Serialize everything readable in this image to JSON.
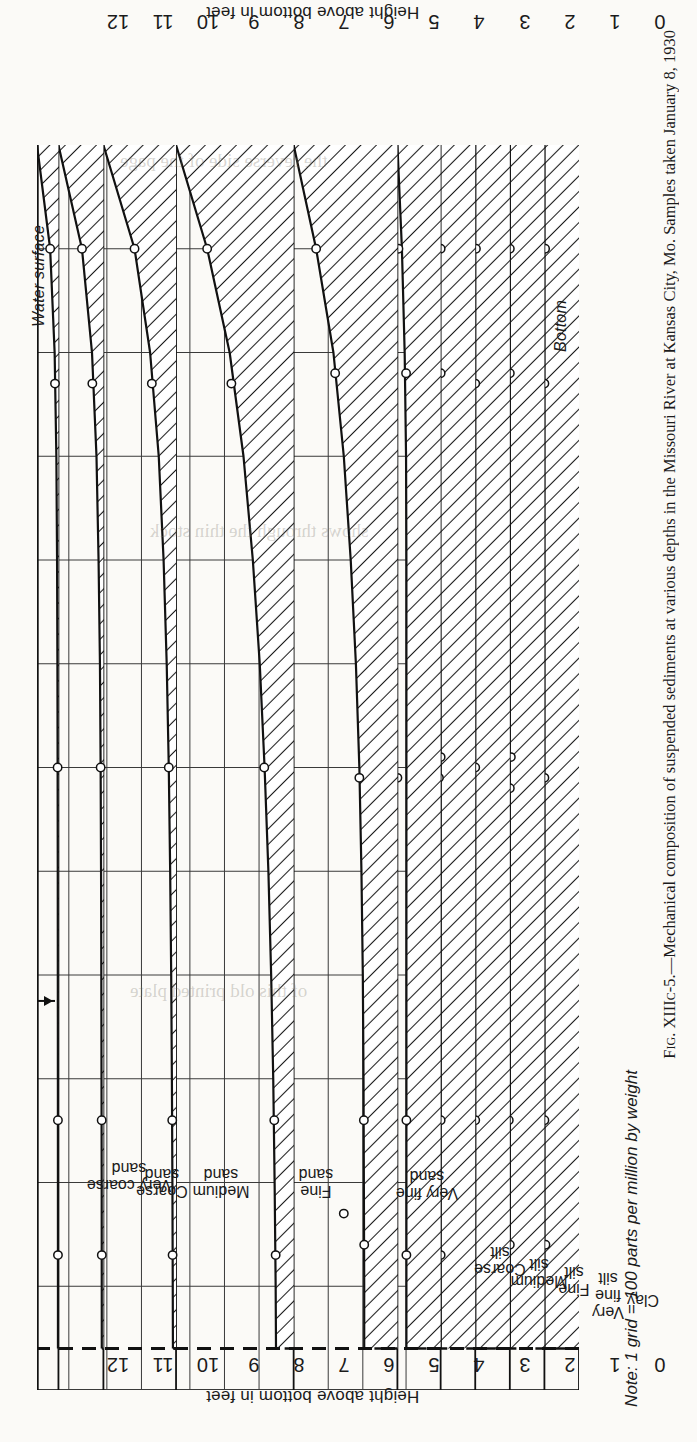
{
  "figure": {
    "note": "Note: 1 grid = 100 parts per million by weight",
    "caption_label": "Fig. XIIIc-5.",
    "caption_dash": "—",
    "caption_text": "Mechanical composition of suspended sediments at various depths in the Missouri River at Kansas City, Mo.   Samples taken January 8, 1930",
    "caption_full": "Fig. XIIIc-5.—Mechanical composition of suspended sediments at various depths in the Missouri River at Kansas City, Mo.   Samples taken January 8, 1930"
  },
  "axes": {
    "y_title_bottom": "Height above bottom in feet",
    "y_title_top": "Height above bottom in feet",
    "y_ticks": [
      "0",
      "1",
      "2",
      "3",
      "4",
      "5",
      "6",
      "7",
      "8",
      "9",
      "10",
      "11",
      "12"
    ],
    "y_min": 0,
    "y_max": 12,
    "x_unit_per_grid_ppm": 100,
    "water_surface_label": "Water surface",
    "bottom_label": "Bottom"
  },
  "chart_data": {
    "type": "area",
    "title": "Mechanical composition of suspended sediments at various depths in the Missouri River at Kansas City, Mo.",
    "xlabel": "Concentration (grid = 100 parts per million by weight)",
    "ylabel": "Height above bottom in feet",
    "ylim": [
      0,
      12
    ],
    "grid": true,
    "legend": "none",
    "orientation": "horizontal-bands: each size class is its own panel; shaded area = concentration profile vs height",
    "water_surface_ft": 11.6,
    "heights_ft": [
      0,
      1,
      2,
      3,
      4,
      5,
      6,
      7,
      8,
      9,
      10,
      11,
      11.6
    ],
    "series": [
      {
        "name": "Clay",
        "panel_width_grids": 1.0,
        "values_grids": [
          1.0,
          1.0,
          1.0,
          1.0,
          1.0,
          1.0,
          1.0,
          1.0,
          1.0,
          1.0,
          1.0,
          1.0,
          1.0
        ],
        "sample_points": [
          {
            "height_ft": 1.0,
            "value_grids": 0.98
          },
          {
            "height_ft": 2.3,
            "value_grids": 1.0
          },
          {
            "height_ft": 6.1,
            "value_grids": 1.0
          },
          {
            "height_ft": 9.4,
            "value_grids": 1.0
          },
          {
            "height_ft": 10.6,
            "value_grids": 0.97
          }
        ]
      },
      {
        "name": "Very fine silt",
        "panel_width_grids": 1.0,
        "values_grids": [
          1.0,
          1.0,
          1.0,
          1.0,
          1.0,
          1.0,
          1.0,
          1.0,
          1.0,
          1.0,
          1.0,
          1.0,
          1.0
        ],
        "sample_points": [
          {
            "height_ft": 1.0,
            "value_grids": 1.0
          },
          {
            "height_ft": 2.2,
            "value_grids": 1.0
          },
          {
            "height_ft": 5.9,
            "value_grids": 0.97
          },
          {
            "height_ft": 6.2,
            "value_grids": 1.0
          },
          {
            "height_ft": 9.4,
            "value_grids": 1.03
          },
          {
            "height_ft": 10.6,
            "value_grids": 1.0
          }
        ]
      },
      {
        "name": "Fine silt",
        "panel_width_grids": 1.0,
        "values_grids": [
          1.0,
          1.0,
          1.0,
          1.0,
          1.0,
          1.0,
          1.0,
          1.0,
          1.0,
          1.0,
          1.0,
          1.0,
          1.0
        ],
        "sample_points": [
          {
            "height_ft": 1.0,
            "value_grids": 0.98
          },
          {
            "height_ft": 2.3,
            "value_grids": 1.0
          },
          {
            "height_ft": 6.0,
            "value_grids": 1.0
          },
          {
            "height_ft": 9.4,
            "value_grids": 1.0
          },
          {
            "height_ft": 10.8,
            "value_grids": 1.1
          }
        ]
      },
      {
        "name": "Medium silt",
        "panel_width_grids": 1.0,
        "values_grids": [
          1.05,
          1.04,
          1.03,
          1.02,
          1.02,
          1.01,
          1.0,
          1.0,
          1.0,
          1.0,
          1.0,
          1.0,
          1.0
        ],
        "sample_points": [
          {
            "height_ft": 1.0,
            "value_grids": 1.0
          },
          {
            "height_ft": 2.2,
            "value_grids": 1.0
          },
          {
            "height_ft": 5.9,
            "value_grids": 1.0
          },
          {
            "height_ft": 6.1,
            "value_grids": 1.05
          },
          {
            "height_ft": 9.4,
            "value_grids": 1.0
          },
          {
            "height_ft": 10.7,
            "value_grids": 1.0
          }
        ]
      },
      {
        "name": "Coarse silt",
        "panel_width_grids": 1.25,
        "values_grids": [
          1.25,
          1.12,
          1.04,
          1.0,
          0.99,
          0.99,
          0.99,
          0.99,
          0.99,
          0.99,
          0.99,
          0.99,
          0.99
        ],
        "sample_points": [
          {
            "height_ft": 1.0,
            "value_grids": 1.22
          },
          {
            "height_ft": 2.2,
            "value_grids": 1.0
          },
          {
            "height_ft": 6.1,
            "value_grids": 1.25
          },
          {
            "height_ft": 9.4,
            "value_grids": 0.99
          },
          {
            "height_ft": 10.7,
            "value_grids": 0.99
          }
        ]
      },
      {
        "name": "Very fine sand",
        "panel_width_grids": 3.0,
        "values_grids": [
          3.0,
          2.35,
          1.85,
          1.55,
          1.35,
          1.2,
          1.1,
          1.04,
          1.0,
          0.98,
          0.97,
          0.96,
          0.96
        ],
        "sample_points": [
          {
            "height_ft": 1.0,
            "value_grids": 2.35
          },
          {
            "height_ft": 2.2,
            "value_grids": 1.8
          },
          {
            "height_ft": 6.1,
            "value_grids": 1.1
          },
          {
            "height_ft": 9.4,
            "value_grids": 0.97
          },
          {
            "height_ft": 10.6,
            "value_grids": 0.96
          },
          {
            "height_ft": 10.3,
            "value_grids": 1.55
          }
        ]
      },
      {
        "name": "Fine sand",
        "panel_width_grids": 3.4,
        "values_grids": [
          3.4,
          2.5,
          1.85,
          1.45,
          1.18,
          0.98,
          0.84,
          0.73,
          0.65,
          0.59,
          0.55,
          0.52,
          0.51
        ],
        "sample_points": [
          {
            "height_ft": 1.0,
            "value_grids": 2.5
          },
          {
            "height_ft": 2.3,
            "value_grids": 1.8
          },
          {
            "height_ft": 6.0,
            "value_grids": 0.85
          },
          {
            "height_ft": 9.4,
            "value_grids": 0.56
          },
          {
            "height_ft": 10.7,
            "value_grids": 0.52
          }
        ]
      },
      {
        "name": "Medium sand",
        "panel_width_grids": 2.1,
        "values_grids": [
          2.1,
          1.2,
          0.75,
          0.5,
          0.36,
          0.27,
          0.21,
          0.17,
          0.14,
          0.12,
          0.105,
          0.095,
          0.09
        ],
        "sample_points": [
          {
            "height_ft": 1.0,
            "value_grids": 1.2
          },
          {
            "height_ft": 2.3,
            "value_grids": 0.7
          },
          {
            "height_ft": 6.0,
            "value_grids": 0.21
          },
          {
            "height_ft": 9.4,
            "value_grids": 0.11
          },
          {
            "height_ft": 10.7,
            "value_grids": 0.1
          }
        ]
      },
      {
        "name": "Coarse sand",
        "panel_width_grids": 1.3,
        "values_grids": [
          1.3,
          0.62,
          0.33,
          0.2,
          0.14,
          0.1,
          0.08,
          0.068,
          0.06,
          0.055,
          0.05,
          0.048,
          0.047
        ],
        "sample_points": [
          {
            "height_ft": 1.0,
            "value_grids": 0.62
          },
          {
            "height_ft": 2.3,
            "value_grids": 0.32
          },
          {
            "height_ft": 6.0,
            "value_grids": 0.08
          },
          {
            "height_ft": 9.4,
            "value_grids": 0.05
          },
          {
            "height_ft": 10.7,
            "value_grids": 0.047
          }
        ]
      },
      {
        "name": "Very coarse sand",
        "panel_width_grids": 0.62,
        "values_grids": [
          0.62,
          0.24,
          0.11,
          0.06,
          0.04,
          0.03,
          0.024,
          0.02,
          0.018,
          0.016,
          0.015,
          0.014,
          0.014
        ],
        "sample_points": [
          {
            "height_ft": 1.0,
            "value_grids": 0.24
          },
          {
            "height_ft": 2.3,
            "value_grids": 0.1
          },
          {
            "height_ft": 6.0,
            "value_grids": 0.024
          },
          {
            "height_ft": 9.4,
            "value_grids": 0.015
          },
          {
            "height_ft": 10.7,
            "value_grids": 0.014
          }
        ]
      }
    ]
  },
  "categories": [
    {
      "line1": "Clay",
      "line2": ""
    },
    {
      "line1": "Very",
      "line2": "fine\nsilt"
    },
    {
      "line1": "Fine",
      "line2": "silt"
    },
    {
      "line1": "Medium",
      "line2": "silt"
    },
    {
      "line1": "Coarse",
      "line2": "silt"
    },
    {
      "line1": "Very fine",
      "line2": "sand"
    },
    {
      "line1": "Fine",
      "line2": "sand"
    },
    {
      "line1": "Medium",
      "line2": "sand"
    },
    {
      "line1": "Coarse",
      "line2": "sand"
    },
    {
      "line1": "Very coarse",
      "line2": "sand"
    }
  ],
  "ghost_text": [
    "the reverse side of the page",
    "shows through the thin stock",
    "of this old printed plate"
  ]
}
